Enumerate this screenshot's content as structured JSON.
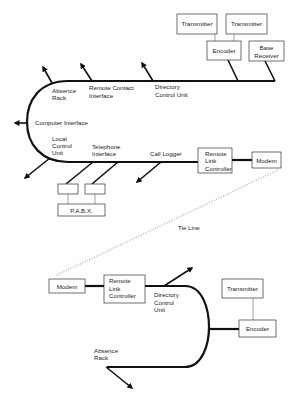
{
  "diagram": {
    "top_section": {
      "boxes": {
        "transmitter_1": "Transmitter",
        "transmitter_2": "Transmitter",
        "encoder": "Encoder",
        "base_receiver_line1": "Base",
        "base_receiver_line2": "Receiver",
        "remote_link_controller_line1": "Remote",
        "remote_link_controller_line2": "Link",
        "remote_link_controller_line3": "Controller",
        "modem": "Modem",
        "pabx": "P.A.B.X."
      },
      "labels": {
        "absence_rack_line1": "Absence",
        "absence_rack_line2": "Rack",
        "remote_contact_line1": "Remote Contact",
        "remote_contact_line2": "Interface",
        "directory_line1": "Directory",
        "directory_line2": "Control Unit",
        "computer_interface": "Computer Interface",
        "local_control_line1": "Local",
        "local_control_line2": "Control",
        "local_control_line3": "Unit",
        "telephone_line1": "Telephone",
        "telephone_line2": "Interface",
        "call_logger": "Call Logger"
      }
    },
    "tie_line": "Tie Line",
    "bottom_section": {
      "boxes": {
        "modem": "Modem",
        "remote_link_controller_line1": "Remote",
        "remote_link_controller_line2": "Link",
        "remote_link_controller_line3": "Controller",
        "transmitter": "Transmitter",
        "encoder": "Encoder"
      },
      "labels": {
        "directory_line1": "Directory",
        "directory_line2": "Control",
        "directory_line3": "Unit",
        "absence_rack_line1": "Absence",
        "absence_rack_line2": "Rack"
      }
    }
  }
}
